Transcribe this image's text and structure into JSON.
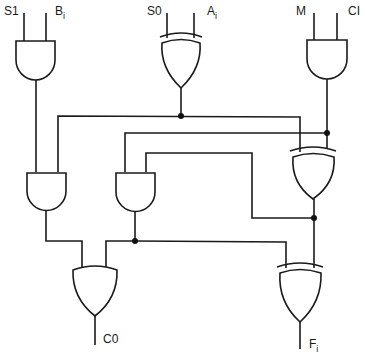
{
  "diagram": {
    "title": "",
    "type": "logic-circuit",
    "inputs": [
      {
        "id": "S1",
        "label": "S1"
      },
      {
        "id": "Bi",
        "label": "B",
        "sub": "i"
      },
      {
        "id": "S0",
        "label": "S0"
      },
      {
        "id": "Ai",
        "label": "A",
        "sub": "i"
      },
      {
        "id": "M",
        "label": "M"
      },
      {
        "id": "CI",
        "label": "CI"
      }
    ],
    "outputs": [
      {
        "id": "C0",
        "label": "C0"
      },
      {
        "id": "Fi",
        "label": "F",
        "sub": "i"
      }
    ],
    "gates": [
      {
        "id": "and_s1_bi",
        "type": "AND",
        "inputs": [
          "S1",
          "Bi"
        ]
      },
      {
        "id": "xor_s0_ai",
        "type": "XOR",
        "inputs": [
          "S0",
          "Ai"
        ]
      },
      {
        "id": "and_m_ci",
        "type": "AND",
        "inputs": [
          "M",
          "CI"
        ]
      },
      {
        "id": "and_left",
        "type": "AND",
        "inputs": [
          "and_s1_bi",
          "xor_s0_ai"
        ]
      },
      {
        "id": "and_mid",
        "type": "AND",
        "inputs": [
          "and_m_ci",
          "xor_mid"
        ]
      },
      {
        "id": "xor_mid",
        "type": "XOR",
        "inputs": [
          "xor_s0_ai",
          "and_m_ci"
        ]
      },
      {
        "id": "or_c0",
        "type": "OR",
        "inputs": [
          "and_left",
          "and_mid"
        ]
      },
      {
        "id": "xor_fi",
        "type": "XOR",
        "inputs": [
          "and_mid",
          "xor_mid"
        ]
      }
    ],
    "junctions": 5,
    "stroke_color": "#1a1a1a",
    "background": "#ffffff"
  }
}
